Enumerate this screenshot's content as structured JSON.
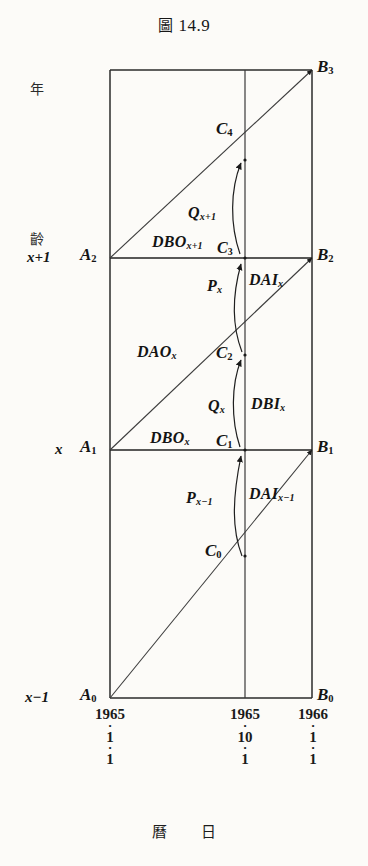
{
  "figure": {
    "title_prefix": "圖",
    "title_number": "14.9",
    "caption_left": "曆",
    "caption_right": "日"
  },
  "axes": {
    "vertical_label_chars": [
      "年",
      "齡"
    ],
    "vertical_label_full": "年齡",
    "horizontal_label": "曆日",
    "age_ticks": [
      {
        "label": "x+1",
        "value": "x+1"
      },
      {
        "label": "x",
        "value": "x"
      },
      {
        "label": "x-1",
        "value": "x−1"
      }
    ],
    "date_ticks": [
      {
        "year": "1965",
        "month": "1",
        "day": "1"
      },
      {
        "year": "1965",
        "month": "10",
        "day": "1"
      },
      {
        "year": "1966",
        "month": "1",
        "day": "1"
      }
    ]
  },
  "vertices": {
    "A0": "A",
    "A0_sub": "0",
    "A1": "A",
    "A1_sub": "1",
    "A2": "A",
    "A2_sub": "2",
    "B0": "B",
    "B0_sub": "0",
    "B1": "B",
    "B1_sub": "1",
    "B2": "B",
    "B2_sub": "2",
    "B3": "B",
    "B3_sub": "3",
    "C0": "C",
    "C0_sub": "0",
    "C1": "C",
    "C1_sub": "1",
    "C2": "C",
    "C2_sub": "2",
    "C3": "C",
    "C3_sub": "3",
    "C4": "C",
    "C4_sub": "4"
  },
  "flows": {
    "DBO_x_plus_1": {
      "base": "DBO",
      "sub": "x+1"
    },
    "DBO_x": {
      "base": "DBO",
      "sub": "x"
    },
    "DAO_x": {
      "base": "DAO",
      "sub": "x"
    },
    "DAI_x": {
      "base": "DAI",
      "sub": "x"
    },
    "DAI_x_minus_1": {
      "base": "DAI",
      "sub": "x−1"
    },
    "DBI_x": {
      "base": "DBI",
      "sub": "x"
    },
    "Q_x_plus_1": {
      "base": "Q",
      "sub": "x+1"
    },
    "Q_x": {
      "base": "Q",
      "sub": "x"
    },
    "P_x": {
      "base": "P",
      "sub": "x"
    },
    "P_x_minus_1": {
      "base": "P",
      "sub": "x−1"
    }
  },
  "colors": {
    "ink": "#141414",
    "paper": "#fcfbf8",
    "rule": "#2b2b2b"
  }
}
